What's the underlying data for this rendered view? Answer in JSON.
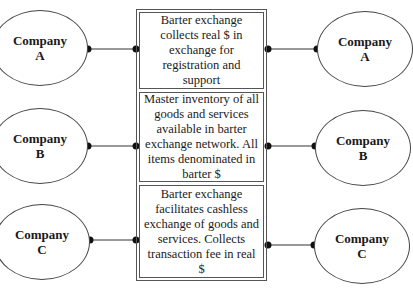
{
  "companies_left": [
    {
      "name": "Company",
      "letter": "A"
    },
    {
      "name": "Company",
      "letter": "B"
    },
    {
      "name": "Company",
      "letter": "C"
    }
  ],
  "companies_right": [
    {
      "name": "Company",
      "letter": "A"
    },
    {
      "name": "Company",
      "letter": "B"
    },
    {
      "name": "Company",
      "letter": "C"
    }
  ],
  "boxes": [
    {
      "text": "Barter exchange collects real $ in exchange for registration and support"
    },
    {
      "text": "Master inventory of all goods and services available in barter exchange network. All items denominated in barter $"
    },
    {
      "text": "Barter exchange facilitates cashless exchange of goods and services. Collects transaction fee in real $"
    }
  ]
}
